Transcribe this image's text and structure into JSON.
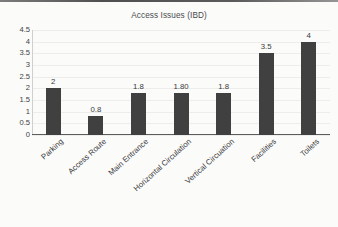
{
  "chart_data": {
    "type": "bar",
    "title": "Access Issues (IBD)",
    "xlabel": "",
    "ylabel": "",
    "ylim": [
      0,
      4.5
    ],
    "grid": true,
    "legend": "none",
    "categories": [
      "Parking",
      "Access Route",
      "Main Entrance",
      "Horizontal Circulation",
      "Vertical Circuation",
      "Facilities",
      "Toilets"
    ],
    "values": [
      2,
      0.8,
      1.8,
      1.8,
      1.8,
      3.5,
      4
    ],
    "data_labels": [
      "2",
      "0.8",
      "1.8",
      "1.80",
      "1.8",
      "3.5",
      "4"
    ],
    "yticks": [
      "0",
      "0.5",
      "1",
      "1.5",
      "2",
      "2.5",
      "3",
      "3.5",
      "4",
      "4.5"
    ],
    "ytick_values": [
      0,
      0.5,
      1,
      1.5,
      2,
      2.5,
      3,
      3.5,
      4,
      4.5
    ],
    "series_color": "#404040",
    "gridline_color": "#ededec",
    "axis_color": "#5c5c5c",
    "background_color": "#fbfbfa"
  }
}
